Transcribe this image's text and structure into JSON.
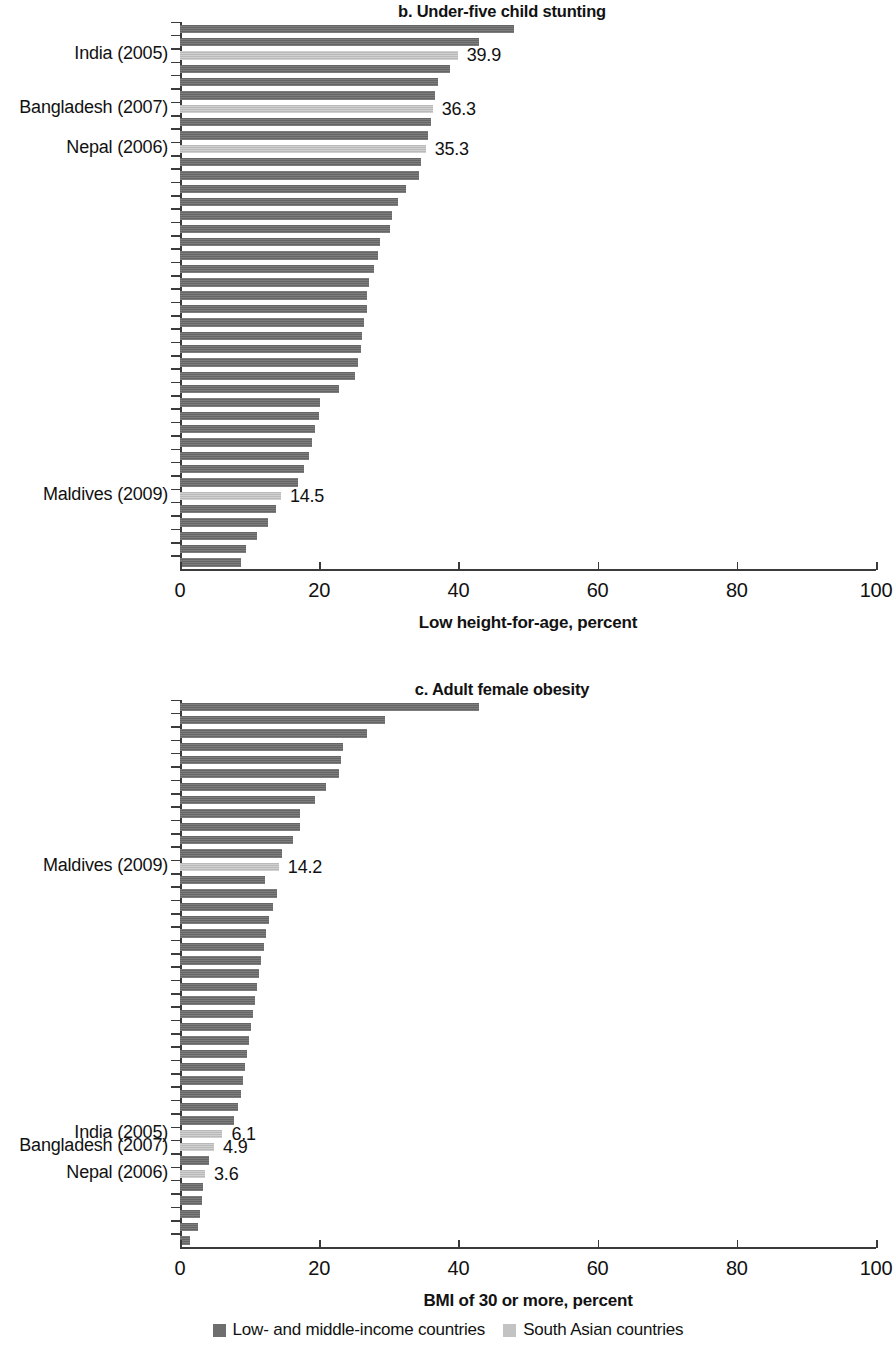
{
  "legend": {
    "items": [
      {
        "label": "Low- and middle-income countries",
        "color": "#6e6e6e",
        "key": "lmic"
      },
      {
        "label": "South Asian countries",
        "color": "#c3c3c3",
        "key": "sa"
      }
    ]
  },
  "panels": [
    {
      "id": "panel-b",
      "title": "b. Under-five child stunting",
      "axis_title": "Low height-for-age, percent"
    },
    {
      "id": "panel-c",
      "title": "c. Adult female obesity",
      "axis_title": "BMI of 30 or more, percent"
    }
  ],
  "axis": {
    "ticks": [
      "0",
      "20",
      "40",
      "60",
      "80",
      "100"
    ],
    "min": 0,
    "max": 100
  },
  "chart_data": [
    {
      "type": "bar",
      "orientation": "horizontal",
      "title": "b. Under-five child stunting",
      "xlabel": "Low height-for-age, percent",
      "ylabel": "",
      "xlim": [
        0,
        100
      ],
      "xticks": [
        0,
        20,
        40,
        60,
        80,
        100
      ],
      "grid": false,
      "legend_position": "bottom",
      "sorted": "descending",
      "series": [
        {
          "name": "Low- and middle-income countries",
          "color": "#6e6e6e"
        },
        {
          "name": "South Asian countries",
          "color": "#c3c3c3"
        }
      ],
      "bars": [
        {
          "value": 48.0,
          "group": "lmic"
        },
        {
          "value": 43.0,
          "group": "lmic"
        },
        {
          "value": 39.9,
          "group": "sa",
          "label": "India (2005)",
          "value_label": "39.9"
        },
        {
          "value": 38.8,
          "group": "lmic"
        },
        {
          "value": 37.0,
          "group": "lmic"
        },
        {
          "value": 36.7,
          "group": "lmic"
        },
        {
          "value": 36.3,
          "group": "sa",
          "label": "Bangladesh (2007)",
          "value_label": "36.3"
        },
        {
          "value": 36.0,
          "group": "lmic"
        },
        {
          "value": 35.6,
          "group": "lmic"
        },
        {
          "value": 35.3,
          "group": "sa",
          "label": "Nepal (2006)",
          "value_label": "35.3"
        },
        {
          "value": 34.6,
          "group": "lmic"
        },
        {
          "value": 34.4,
          "group": "lmic"
        },
        {
          "value": 32.4,
          "group": "lmic"
        },
        {
          "value": 31.3,
          "group": "lmic"
        },
        {
          "value": 30.4,
          "group": "lmic"
        },
        {
          "value": 30.2,
          "group": "lmic"
        },
        {
          "value": 28.8,
          "group": "lmic"
        },
        {
          "value": 28.5,
          "group": "lmic"
        },
        {
          "value": 27.9,
          "group": "lmic"
        },
        {
          "value": 27.2,
          "group": "lmic"
        },
        {
          "value": 26.9,
          "group": "lmic"
        },
        {
          "value": 26.8,
          "group": "lmic"
        },
        {
          "value": 26.5,
          "group": "lmic"
        },
        {
          "value": 26.2,
          "group": "lmic"
        },
        {
          "value": 26.0,
          "group": "lmic"
        },
        {
          "value": 25.6,
          "group": "lmic"
        },
        {
          "value": 25.1,
          "group": "lmic"
        },
        {
          "value": 22.8,
          "group": "lmic"
        },
        {
          "value": 20.1,
          "group": "lmic"
        },
        {
          "value": 19.9,
          "group": "lmic"
        },
        {
          "value": 19.4,
          "group": "lmic"
        },
        {
          "value": 19.0,
          "group": "lmic"
        },
        {
          "value": 18.5,
          "group": "lmic"
        },
        {
          "value": 17.8,
          "group": "lmic"
        },
        {
          "value": 17.0,
          "group": "lmic"
        },
        {
          "value": 14.5,
          "group": "sa",
          "label": "Maldives (2009)",
          "value_label": "14.5"
        },
        {
          "value": 13.8,
          "group": "lmic"
        },
        {
          "value": 12.6,
          "group": "lmic"
        },
        {
          "value": 11.1,
          "group": "lmic"
        },
        {
          "value": 9.5,
          "group": "lmic"
        },
        {
          "value": 8.7,
          "group": "lmic"
        }
      ]
    },
    {
      "type": "bar",
      "orientation": "horizontal",
      "title": "c. Adult female obesity",
      "xlabel": "BMI of 30 or more, percent",
      "ylabel": "",
      "xlim": [
        0,
        100
      ],
      "xticks": [
        0,
        20,
        40,
        60,
        80,
        100
      ],
      "grid": false,
      "legend_position": "bottom",
      "sorted": "descending",
      "series": [
        {
          "name": "Low- and middle-income countries",
          "color": "#6e6e6e"
        },
        {
          "name": "South Asian countries",
          "color": "#c3c3c3"
        }
      ],
      "bars": [
        {
          "value": 43.0,
          "group": "lmic"
        },
        {
          "value": 29.5,
          "group": "lmic"
        },
        {
          "value": 26.8,
          "group": "lmic"
        },
        {
          "value": 23.4,
          "group": "lmic"
        },
        {
          "value": 23.1,
          "group": "lmic"
        },
        {
          "value": 22.9,
          "group": "lmic"
        },
        {
          "value": 21.0,
          "group": "lmic"
        },
        {
          "value": 19.4,
          "group": "lmic"
        },
        {
          "value": 17.3,
          "group": "lmic"
        },
        {
          "value": 17.2,
          "group": "lmic"
        },
        {
          "value": 16.3,
          "group": "lmic"
        },
        {
          "value": 14.6,
          "group": "lmic"
        },
        {
          "value": 14.2,
          "group": "sa",
          "label": "Maldives (2009)",
          "value_label": "14.2"
        },
        {
          "value": 12.2,
          "group": "lmic"
        },
        {
          "value": 13.9,
          "group": "lmic"
        },
        {
          "value": 13.3,
          "group": "lmic"
        },
        {
          "value": 12.8,
          "group": "lmic"
        },
        {
          "value": 12.4,
          "group": "lmic"
        },
        {
          "value": 12.0,
          "group": "lmic"
        },
        {
          "value": 11.6,
          "group": "lmic"
        },
        {
          "value": 11.3,
          "group": "lmic"
        },
        {
          "value": 11.1,
          "group": "lmic"
        },
        {
          "value": 10.8,
          "group": "lmic"
        },
        {
          "value": 10.5,
          "group": "lmic"
        },
        {
          "value": 10.2,
          "group": "lmic"
        },
        {
          "value": 9.9,
          "group": "lmic"
        },
        {
          "value": 9.6,
          "group": "lmic"
        },
        {
          "value": 9.3,
          "group": "lmic"
        },
        {
          "value": 9.0,
          "group": "lmic"
        },
        {
          "value": 8.7,
          "group": "lmic"
        },
        {
          "value": 8.3,
          "group": "lmic"
        },
        {
          "value": 7.7,
          "group": "lmic"
        },
        {
          "value": 6.1,
          "group": "sa",
          "label": "India (2005)",
          "value_label": "6.1"
        },
        {
          "value": 4.9,
          "group": "sa",
          "label": "Bangladesh (2007)",
          "value_label": "4.9"
        },
        {
          "value": 4.2,
          "group": "lmic"
        },
        {
          "value": 3.6,
          "group": "sa",
          "label": "Nepal (2006)",
          "value_label": "3.6"
        },
        {
          "value": 3.3,
          "group": "lmic"
        },
        {
          "value": 3.1,
          "group": "lmic"
        },
        {
          "value": 2.9,
          "group": "lmic"
        },
        {
          "value": 2.6,
          "group": "lmic"
        },
        {
          "value": 1.4,
          "group": "lmic"
        }
      ]
    }
  ]
}
